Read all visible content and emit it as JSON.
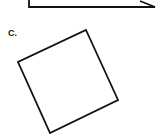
{
  "figure": {
    "stroke_color": "#111111",
    "stroke_width": 1.8,
    "partial_shape": {
      "description": "bottom portion of previous figure (cut off)",
      "points": "29,0 29,7 155,7 140,1"
    },
    "square": {
      "label": "C.",
      "points": "86,30 118,100 50,133 18,62"
    }
  }
}
